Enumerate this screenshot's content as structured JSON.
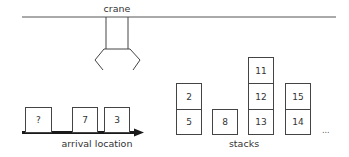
{
  "crane": {
    "label": "crane"
  },
  "arrival": {
    "label": "arrival location",
    "containers": [
      {
        "label": "?",
        "x": 25,
        "y": 107,
        "w": 27,
        "h": 26
      },
      {
        "label": "7",
        "x": 72,
        "y": 107,
        "w": 26,
        "h": 26
      },
      {
        "label": "3",
        "x": 104,
        "y": 107,
        "w": 26,
        "h": 26
      }
    ]
  },
  "stacks": {
    "label": "stacks",
    "more_indicator": "...",
    "columns": [
      {
        "x": 176,
        "boxes": [
          "2",
          "5"
        ]
      },
      {
        "x": 212,
        "boxes": [
          "8"
        ]
      },
      {
        "x": 248,
        "boxes": [
          "11",
          "12",
          "13"
        ]
      },
      {
        "x": 285,
        "boxes": [
          "15",
          "14"
        ]
      }
    ]
  },
  "colors": {
    "line": "#444444",
    "arrow": "#1a1a1a",
    "text": "#333333"
  }
}
